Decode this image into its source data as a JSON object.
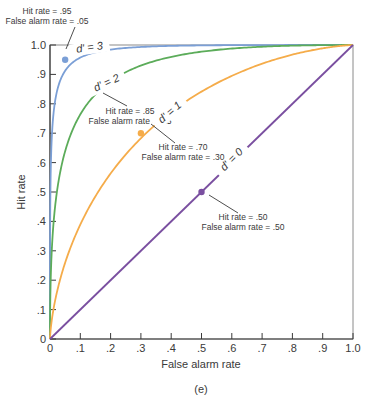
{
  "chart_data": {
    "type": "line",
    "title": "",
    "panel_label": "(e)",
    "xlabel": "False alarm rate",
    "ylabel": "Hit rate",
    "xlim": [
      0,
      1.0
    ],
    "ylim": [
      0,
      1.0
    ],
    "grid": false,
    "legend": "inline curve labels",
    "x_ticks": [
      "0",
      ".1",
      ".2",
      ".3",
      ".4",
      ".5",
      ".6",
      ".7",
      ".8",
      ".9",
      "1.0"
    ],
    "y_ticks": [
      "0",
      ".1",
      ".2",
      ".3",
      ".4",
      ".5",
      ".6",
      ".7",
      ".8",
      ".9",
      "1.0"
    ],
    "series": [
      {
        "name": "d' = 3",
        "d_prime": 3,
        "color": "#7b9fd6",
        "x": [
          0,
          0.001,
          0.005,
          0.01,
          0.02,
          0.05,
          0.1,
          0.2,
          0.3,
          0.5,
          0.7,
          1.0
        ],
        "y": [
          0,
          0.32,
          0.64,
          0.76,
          0.86,
          0.95,
          0.98,
          0.995,
          0.998,
          0.999,
          1.0,
          1.0
        ],
        "highlight": {
          "x": 0.05,
          "y": 0.95,
          "annotation": [
            "Hit rate = .95",
            "False alarm rate = .05"
          ]
        }
      },
      {
        "name": "d' = 2",
        "d_prime": 2,
        "color": "#5cac5a",
        "x": [
          0,
          0.01,
          0.02,
          0.05,
          0.1,
          0.15,
          0.2,
          0.3,
          0.4,
          0.5,
          0.7,
          1.0
        ],
        "y": [
          0,
          0.37,
          0.5,
          0.68,
          0.8,
          0.85,
          0.89,
          0.94,
          0.96,
          0.98,
          0.99,
          1.0
        ],
        "highlight": {
          "x": 0.15,
          "y": 0.85,
          "annotation": [
            "Hit rate = .85",
            "False alarm rate = .15"
          ]
        }
      },
      {
        "name": "d' = 1",
        "d_prime": 1,
        "color": "#f5ac4a",
        "x": [
          0,
          0.05,
          0.1,
          0.2,
          0.3,
          0.4,
          0.5,
          0.6,
          0.7,
          0.8,
          0.9,
          1.0
        ],
        "y": [
          0,
          0.26,
          0.39,
          0.56,
          0.7,
          0.77,
          0.84,
          0.89,
          0.93,
          0.96,
          0.98,
          1.0
        ],
        "highlight": {
          "x": 0.3,
          "y": 0.7,
          "annotation": [
            "Hit rate = .70",
            "False alarm rate = .30"
          ]
        }
      },
      {
        "name": "d' = 0",
        "d_prime": 0,
        "color": "#7a4fa0",
        "x": [
          0,
          1.0
        ],
        "y": [
          0,
          1.0
        ],
        "highlight": {
          "x": 0.5,
          "y": 0.5,
          "annotation": [
            "Hit rate = .50",
            "False alarm rate = .50"
          ]
        }
      }
    ]
  }
}
